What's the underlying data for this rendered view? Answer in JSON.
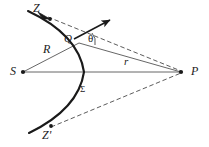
{
  "figure": {
    "caption": "",
    "background_color": "#ffffff",
    "line_color": "#3a3a3a",
    "curve_color": "#1a1a1a",
    "label_color": "#1a1a1a"
  },
  "labels": {
    "z_top": "Z",
    "z_bottom": "Z'",
    "point_q": "Q",
    "angle_theta": "θ",
    "radius_R": "R",
    "radius_r": "r",
    "source_S": "S",
    "point_P": "P",
    "surface_sigma": "Σ"
  },
  "geometry": {
    "points": {
      "S": [
        22,
        72
      ],
      "P": [
        182,
        72
      ],
      "Q": [
        78,
        43
      ],
      "Z": [
        47,
        16
      ],
      "Zprime": [
        50,
        127
      ]
    },
    "arc": {
      "start": [
        28,
        12
      ],
      "end": [
        28,
        133
      ],
      "apex": [
        93,
        72
      ],
      "description": "convex-left circular arc (wavefront sigma) centered near S"
    },
    "solid_lines": [
      {
        "name": "S-to-Q",
        "from": [
          22,
          72
        ],
        "to": [
          78,
          43
        ],
        "label": "R"
      },
      {
        "name": "S-to-P",
        "from": [
          22,
          72
        ],
        "to": [
          182,
          72
        ],
        "label": ""
      },
      {
        "name": "Q-to-P",
        "from": [
          78,
          43
        ],
        "to": [
          182,
          72
        ],
        "label": "r"
      }
    ],
    "dashed_lines": [
      {
        "name": "Z-to-P",
        "from": [
          47,
          16
        ],
        "to": [
          182,
          72
        ]
      },
      {
        "name": "Zprime-to-P",
        "from": [
          50,
          127
        ],
        "to": [
          182,
          72
        ]
      }
    ],
    "normal_arrow": {
      "from": [
        78,
        43
      ],
      "to": [
        111,
        20
      ],
      "style": "solid-arrowhead"
    },
    "angle_arc": {
      "at": [
        78,
        43
      ],
      "between": [
        "normal_arrow",
        "Q-to-P"
      ],
      "label": "θ"
    }
  }
}
